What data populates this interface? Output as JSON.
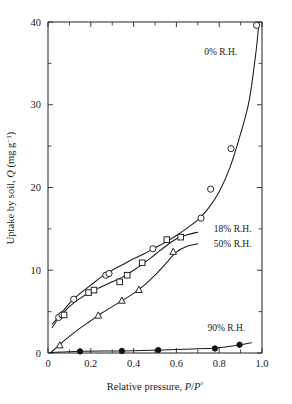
{
  "chart_data": {
    "type": "scatter",
    "title": "",
    "xlabel": "Relative pressure, P/P°",
    "xlabel_parts": {
      "prefix": "Relative pressure, ",
      "var1": "P",
      "slash": "/",
      "var2": "P",
      "sup": "°"
    },
    "ylabel": "Uptake by soil, Q (mg g⁻¹)",
    "ylabel_parts": {
      "prefix": "Uptake by soil, ",
      "var": "Q",
      "units_open": " (mg g",
      "units_sup": "−1",
      "units_close": ")"
    },
    "xlim": [
      0,
      1.0
    ],
    "ylim": [
      0,
      40
    ],
    "xticks": [
      0,
      0.2,
      0.4,
      0.6,
      0.8,
      1.0
    ],
    "xticklabels": [
      "0",
      "0.2",
      "0.4",
      "0.6",
      "0.8",
      "1.0"
    ],
    "xticks_minor": [
      0.1,
      0.3,
      0.5,
      0.7,
      0.9
    ],
    "yticks": [
      0,
      10,
      20,
      30,
      40
    ],
    "yticklabels": [
      "0",
      "10",
      "20",
      "30",
      "40"
    ],
    "yticks_minor": [
      5,
      15,
      25,
      35
    ],
    "grid": false,
    "legend_position": "inline-annotations",
    "series": [
      {
        "name": "0% R.H.",
        "label": "0% R.H.",
        "marker": "open-circle",
        "label_x": 0.73,
        "label_y": 36.0,
        "x": [
          0.05,
          0.065,
          0.12,
          0.27,
          0.285,
          0.49,
          0.715,
          0.76,
          0.855,
          0.975
        ],
        "y": [
          4.3,
          4.6,
          6.5,
          9.4,
          9.6,
          12.6,
          16.3,
          19.8,
          24.7,
          39.6
        ],
        "curve_x": [
          0.02,
          0.05,
          0.1,
          0.15,
          0.2,
          0.25,
          0.3,
          0.35,
          0.4,
          0.45,
          0.5,
          0.55,
          0.6,
          0.65,
          0.7,
          0.75,
          0.8,
          0.85,
          0.9,
          0.94,
          0.97,
          0.985
        ],
        "curve_y": [
          3.5,
          4.4,
          6.0,
          7.2,
          8.2,
          9.2,
          10.0,
          10.7,
          11.4,
          12.0,
          12.7,
          13.4,
          14.2,
          15.1,
          16.1,
          17.5,
          19.5,
          22.4,
          26.5,
          30.5,
          36.0,
          39.7
        ]
      },
      {
        "name": "18% R.H.",
        "label": "18% R.H.",
        "marker": "open-square",
        "label_x": 0.775,
        "label_y": 14.6,
        "x": [
          0.075,
          0.19,
          0.215,
          0.335,
          0.37,
          0.44,
          0.555,
          0.62
        ],
        "y": [
          4.6,
          7.3,
          7.6,
          8.6,
          9.4,
          10.9,
          13.7,
          14.0
        ],
        "curve_x": [
          0.02,
          0.05,
          0.1,
          0.15,
          0.2,
          0.25,
          0.3,
          0.35,
          0.4,
          0.45,
          0.5,
          0.55,
          0.6,
          0.65,
          0.7
        ],
        "curve_y": [
          3.1,
          4.2,
          5.6,
          6.6,
          7.4,
          8.0,
          8.6,
          9.2,
          10.0,
          10.9,
          11.9,
          12.9,
          13.8,
          14.3,
          14.6
        ]
      },
      {
        "name": "50% R.H.",
        "label": "50% R.H.",
        "marker": "open-triangle",
        "label_x": 0.775,
        "label_y": 12.8,
        "x": [
          0.055,
          0.235,
          0.345,
          0.425,
          0.585
        ],
        "y": [
          0.9,
          4.5,
          6.3,
          7.6,
          12.2
        ],
        "curve_x": [
          0.015,
          0.05,
          0.1,
          0.15,
          0.2,
          0.25,
          0.3,
          0.35,
          0.4,
          0.45,
          0.5,
          0.55,
          0.6,
          0.65,
          0.7
        ],
        "curve_y": [
          0.1,
          0.9,
          2.0,
          3.0,
          3.9,
          4.8,
          5.6,
          6.4,
          7.2,
          8.2,
          9.4,
          10.8,
          12.2,
          12.9,
          13.2
        ]
      },
      {
        "name": "90% R.H.",
        "label": "90% R.H.",
        "marker": "filled-circle",
        "label_x": 0.745,
        "label_y": 2.7,
        "x": [
          0.15,
          0.345,
          0.515,
          0.78,
          0.895
        ],
        "y": [
          0.2,
          0.25,
          0.35,
          0.55,
          1.0
        ],
        "curve_x": [
          0.01,
          0.15,
          0.35,
          0.52,
          0.78,
          0.9,
          0.95
        ],
        "curve_y": [
          0.05,
          0.2,
          0.25,
          0.35,
          0.6,
          1.0,
          1.25
        ]
      }
    ]
  }
}
